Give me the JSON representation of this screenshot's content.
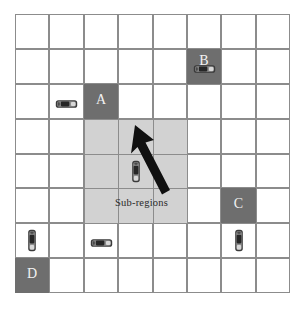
{
  "figure": {
    "type": "grid-diagram",
    "grid": {
      "columns": 8,
      "rows": 8,
      "line_color": "#8c8c8c",
      "background": "#ffffff"
    },
    "colors": {
      "block_fill": "#6e6e6e",
      "block_text": "#f2f2f2",
      "subregion_fill": "#d2d2d2",
      "arrow": "#111111",
      "label_text": "#2a2a2a"
    },
    "blocks": [
      {
        "label": "A",
        "col": 2,
        "row": 2
      },
      {
        "label": "B",
        "col": 5,
        "row": 1
      },
      {
        "label": "C",
        "col": 6,
        "row": 5
      },
      {
        "label": "D",
        "col": 0,
        "row": 7
      }
    ],
    "subregion": {
      "label": "Sub-regions",
      "col_start": 2,
      "row_start": 3,
      "col_span": 3,
      "row_span": 3
    },
    "vehicles": [
      {
        "id": "car-1",
        "col": 1,
        "row": 2,
        "orientation": "horizontal"
      },
      {
        "id": "car-2",
        "col": 5,
        "row": 1,
        "orientation": "horizontal"
      },
      {
        "id": "car-3",
        "col": 3,
        "row": 4,
        "orientation": "vertical"
      },
      {
        "id": "car-4",
        "col": 0,
        "row": 6,
        "orientation": "vertical"
      },
      {
        "id": "car-5",
        "col": 2,
        "row": 6,
        "orientation": "horizontal"
      },
      {
        "id": "car-6",
        "col": 6,
        "row": 6,
        "orientation": "vertical"
      }
    ],
    "arrow": {
      "direction": "up-left",
      "from": {
        "col": 3,
        "row": 4
      },
      "to": {
        "col": 2,
        "row": 2
      }
    }
  }
}
